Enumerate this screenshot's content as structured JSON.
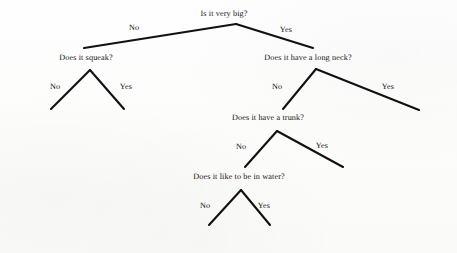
{
  "canvas": {
    "width": 457,
    "height": 253,
    "background": "#fdfdfc",
    "line_color": "#111111",
    "text_color": "#111111"
  },
  "nodes": {
    "root": {
      "text": "Is it very big?",
      "x": 224,
      "y": 13,
      "apex_x": 236,
      "apex_y": 24
    },
    "squeak": {
      "text": "Does it squeak?",
      "x": 86,
      "y": 57,
      "apex_x": 90,
      "apex_y": 70
    },
    "long_neck": {
      "text": "Does it have a long neck?",
      "x": 308,
      "y": 57,
      "apex_x": 316,
      "apex_y": 69
    },
    "trunk": {
      "text": "Does it have a trunk?",
      "x": 268,
      "y": 117,
      "apex_x": 277,
      "apex_y": 131
    },
    "water": {
      "text": "Does it like to be in water?",
      "x": 239,
      "y": 176,
      "apex_x": 241,
      "apex_y": 190
    }
  },
  "leaves": {
    "squirrel": {
      "text": "Guess squirrel",
      "x": 53,
      "y": 118
    },
    "mouse": {
      "text": "Guess mouse",
      "x": 121,
      "y": 118
    },
    "giraffe": {
      "text": "Guess giraffe",
      "x": 414,
      "y": 117
    },
    "elephant": {
      "text": "Guess elephant",
      "x": 337,
      "y": 175
    },
    "rhino": {
      "text": "Guess rhino",
      "x": 204,
      "y": 233
    },
    "hippo": {
      "text": "Guess hippo",
      "x": 263,
      "y": 233
    }
  },
  "edge_labels": {
    "root_no": {
      "text": "No",
      "x": 134,
      "y": 27
    },
    "root_yes": {
      "text": "Yes",
      "x": 286,
      "y": 29
    },
    "squeak_no": {
      "text": "No",
      "x": 55,
      "y": 86
    },
    "squeak_yes": {
      "text": "Yes",
      "x": 126,
      "y": 86
    },
    "neck_no": {
      "text": "No",
      "x": 277,
      "y": 86
    },
    "neck_yes": {
      "text": "Yes",
      "x": 388,
      "y": 86
    },
    "trunk_no": {
      "text": "No",
      "x": 241,
      "y": 146
    },
    "trunk_yes": {
      "text": "Yes",
      "x": 322,
      "y": 145
    },
    "water_no": {
      "text": "No",
      "x": 205,
      "y": 205
    },
    "water_yes": {
      "text": "Yes",
      "x": 264,
      "y": 205
    }
  },
  "edges": [
    {
      "name": "root-to-squeak",
      "x1": 236,
      "y1": 24,
      "x2": 84,
      "y2": 48
    },
    {
      "name": "root-to-long-neck",
      "x1": 236,
      "y1": 24,
      "x2": 313,
      "y2": 48
    },
    {
      "name": "squeak-to-squirrel",
      "x1": 90,
      "y1": 70,
      "x2": 51,
      "y2": 109
    },
    {
      "name": "squeak-to-mouse",
      "x1": 90,
      "y1": 70,
      "x2": 124,
      "y2": 109
    },
    {
      "name": "long-neck-to-trunk",
      "x1": 316,
      "y1": 69,
      "x2": 283,
      "y2": 109
    },
    {
      "name": "long-neck-to-giraffe",
      "x1": 316,
      "y1": 69,
      "x2": 419,
      "y2": 110
    },
    {
      "name": "trunk-to-water",
      "x1": 277,
      "y1": 131,
      "x2": 245,
      "y2": 167
    },
    {
      "name": "trunk-to-elephant",
      "x1": 277,
      "y1": 131,
      "x2": 343,
      "y2": 167
    },
    {
      "name": "water-to-rhino",
      "x1": 241,
      "y1": 190,
      "x2": 209,
      "y2": 225
    },
    {
      "name": "water-to-hippo",
      "x1": 241,
      "y1": 190,
      "x2": 270,
      "y2": 225
    }
  ]
}
